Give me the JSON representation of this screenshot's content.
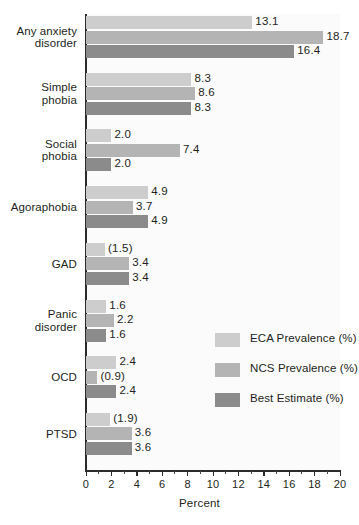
{
  "chart_data": {
    "type": "bar",
    "orientation": "horizontal",
    "title": "",
    "xlabel": "Percent",
    "ylabel": "",
    "xlim": [
      0,
      20
    ],
    "xticks": [
      0,
      2,
      4,
      6,
      8,
      10,
      12,
      14,
      16,
      18,
      20
    ],
    "xtick_labels": [
      "0",
      "2",
      "4",
      "6",
      "8",
      "10",
      "12",
      "14",
      "16",
      "18",
      "20"
    ],
    "grid": false,
    "legend_position": "center-right",
    "categories": [
      "Any anxiety disorder",
      "Simple phobia",
      "Social phobia",
      "Agoraphobia",
      "GAD",
      "Panic disorder",
      "OCD",
      "PTSD"
    ],
    "series": [
      {
        "name": "ECA Prevalence (%)",
        "color": "#cdcdcd",
        "values": [
          13.1,
          8.3,
          2.0,
          4.9,
          1.5,
          1.6,
          2.4,
          1.9
        ],
        "labels": [
          "13.1",
          "8.3",
          "2.0",
          "4.9",
          "(1.5)",
          "1.6",
          "2.4",
          "(1.9)"
        ]
      },
      {
        "name": "NCS Prevalence (%)",
        "color": "#b4b4b4",
        "values": [
          18.7,
          8.6,
          7.4,
          3.7,
          3.4,
          2.2,
          0.9,
          3.6
        ],
        "labels": [
          "18.7",
          "8.6",
          "7.4",
          "3.7",
          "3.4",
          "2.2",
          "(0.9)",
          "3.6"
        ]
      },
      {
        "name": "Best Estimate (%)",
        "color": "#8b8b8b",
        "values": [
          16.4,
          8.3,
          2.0,
          4.9,
          3.4,
          1.6,
          2.4,
          3.6
        ],
        "labels": [
          "16.4",
          "8.3",
          "2.0",
          "4.9",
          "3.4",
          "1.6",
          "2.4",
          "3.6"
        ]
      }
    ]
  },
  "categories_display": [
    {
      "lines": [
        "Any anxiety",
        "disorder"
      ]
    },
    {
      "lines": [
        "Simple",
        "phobia"
      ]
    },
    {
      "lines": [
        "Social",
        "phobia"
      ]
    },
    {
      "lines": [
        "Agoraphobia"
      ]
    },
    {
      "lines": [
        "GAD"
      ]
    },
    {
      "lines": [
        "Panic",
        "disorder"
      ]
    },
    {
      "lines": [
        "OCD"
      ]
    },
    {
      "lines": [
        "PTSD"
      ]
    }
  ],
  "legend": {
    "items": [
      {
        "label": "ECA Prevalence (%)",
        "color": "#cdcdcd"
      },
      {
        "label": "NCS Prevalence (%)",
        "color": "#b4b4b4"
      },
      {
        "label": "Best Estimate (%)",
        "color": "#8b8b8b"
      }
    ]
  },
  "axis": {
    "x_title": "Percent",
    "tick_labels": [
      "0",
      "2",
      "4",
      "6",
      "8",
      "10",
      "12",
      "14",
      "16",
      "18",
      "20"
    ]
  },
  "colors": {
    "eca": "#cdcdcd",
    "ncs": "#b4b4b4",
    "best": "#8b8b8b",
    "axis": "#2b2b2b",
    "text": "#231f20",
    "plot_bg": "#fbfbfb"
  }
}
